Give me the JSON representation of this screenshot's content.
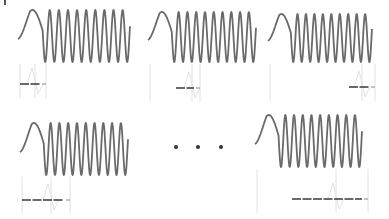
{
  "figure": {
    "width": 389,
    "height": 219,
    "background": "#ffffff",
    "stroke_color": "#6a6a6a",
    "faint_color": "#e2e2e2",
    "baseline_color": "#3a3a3a"
  },
  "panels": [
    {
      "id": "chirp-1",
      "row": 0,
      "col": 0,
      "x0": 18,
      "x1": 130,
      "ymid": 36,
      "amp": 26,
      "onset_x": 20,
      "baseline": {
        "y": 84,
        "x0": 20,
        "x1": 46
      },
      "stem_x": 35
    },
    {
      "id": "chirp-2",
      "row": 0,
      "col": 1,
      "x0": 148,
      "x1": 256,
      "ymid": 37,
      "amp": 25,
      "onset_x": 150,
      "baseline": {
        "y": 88,
        "x0": 176,
        "x1": 200
      },
      "stem_x": 192
    },
    {
      "id": "chirp-3",
      "row": 0,
      "col": 2,
      "x0": 268,
      "x1": 372,
      "ymid": 38,
      "amp": 24,
      "onset_x": 270,
      "baseline": {
        "y": 87,
        "x0": 349,
        "x1": 375
      },
      "stem_x": 362
    },
    {
      "id": "chirp-4",
      "row": 1,
      "col": 0,
      "x0": 20,
      "x1": 128,
      "ymid": 149,
      "amp": 26,
      "onset_x": 22,
      "baseline": {
        "y": 200,
        "x0": 22,
        "x1": 70
      },
      "stem_x": 51
    },
    {
      "id": "chirp-5",
      "row": 1,
      "col": 2,
      "x0": 255,
      "x1": 362,
      "ymid": 141,
      "amp": 26,
      "onset_x": 257,
      "baseline": {
        "y": 199,
        "x0": 292,
        "x1": 368
      },
      "stem_x": 336
    }
  ],
  "ellipsis": {
    "label": "• • •",
    "dots": [
      {
        "x": 176,
        "y": 147
      },
      {
        "x": 198,
        "y": 147
      },
      {
        "x": 221,
        "y": 147
      }
    ]
  }
}
